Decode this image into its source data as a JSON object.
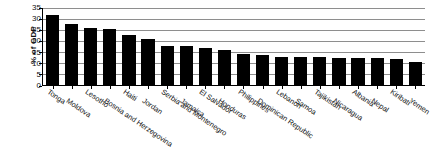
{
  "chart_data": {
    "type": "bar",
    "title": "",
    "xlabel": "",
    "ylabel": "% of GDP",
    "ylim": [
      0,
      35
    ],
    "yticks": [
      0,
      5,
      10,
      15,
      20,
      25,
      30,
      35
    ],
    "grid": true,
    "legend": false,
    "bar_color": "#000000",
    "categories": [
      "Tonga",
      "Moldova",
      "Lesotho",
      "Bosnia and Herzegovina",
      "Haiti",
      "Jordan",
      "Serbia and Montenegro",
      "Jamaica",
      "El Salvador",
      "Honduras",
      "Philippines",
      "Dominican Republic",
      "Lebanon",
      "Samoa",
      "Tajikistan",
      "Nicaragua",
      "Albania",
      "Nepal",
      "Kiribati",
      "Yemen"
    ],
    "values": [
      31.3,
      27.2,
      25.8,
      25.0,
      22.6,
      20.5,
      17.7,
      17.4,
      16.4,
      15.8,
      13.9,
      13.6,
      12.6,
      12.5,
      12.5,
      12.1,
      12.1,
      12.0,
      11.5,
      10.3
    ],
    "tick_labels": [
      "35",
      "30",
      "25",
      "20",
      "15",
      "10",
      "5",
      "0"
    ]
  }
}
